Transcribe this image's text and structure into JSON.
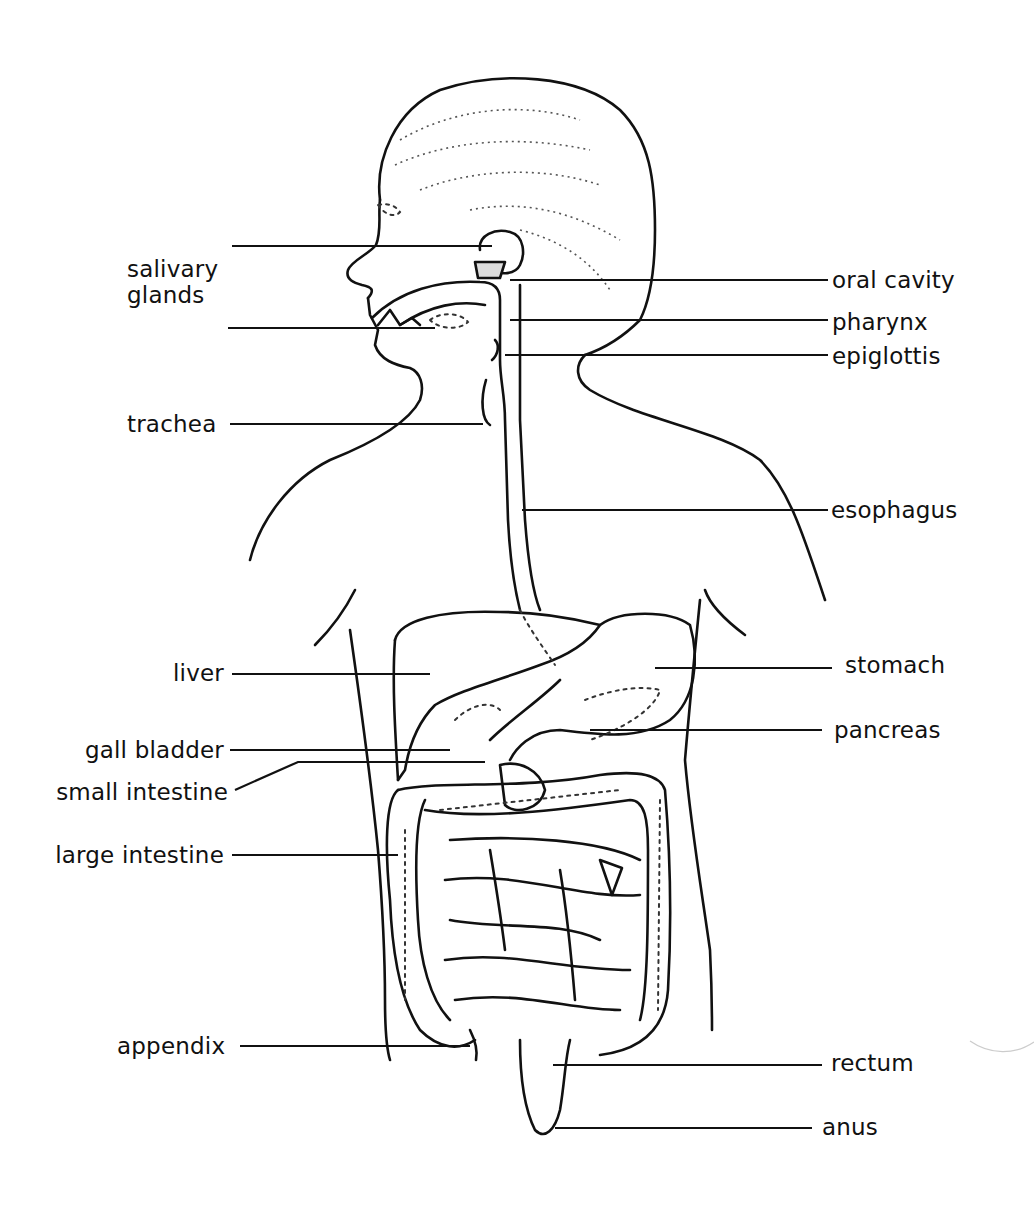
{
  "diagram": {
    "labels_left": [
      {
        "id": "salivary-glands",
        "text_line1": "salivary",
        "text_line2": "glands"
      },
      {
        "id": "trachea",
        "text": "trachea"
      },
      {
        "id": "liver",
        "text": "liver"
      },
      {
        "id": "gall-bladder",
        "text": "gall  bladder"
      },
      {
        "id": "small-intestine",
        "text": "small  intestine"
      },
      {
        "id": "large-intestine",
        "text": "large  intestine"
      },
      {
        "id": "appendix",
        "text": "appendix"
      }
    ],
    "labels_right": [
      {
        "id": "oral-cavity",
        "text": "oral  cavity"
      },
      {
        "id": "pharynx",
        "text": "pharynx"
      },
      {
        "id": "epiglottis",
        "text": "epiglottis"
      },
      {
        "id": "esophagus",
        "text": "esophagus"
      },
      {
        "id": "stomach",
        "text": "stomach"
      },
      {
        "id": "pancreas",
        "text": "pancreas"
      },
      {
        "id": "rectum",
        "text": "rectum"
      },
      {
        "id": "anus",
        "text": "anus"
      }
    ],
    "colors": {
      "line": "#111111",
      "background": "#ffffff",
      "stipple": "#555555"
    }
  }
}
